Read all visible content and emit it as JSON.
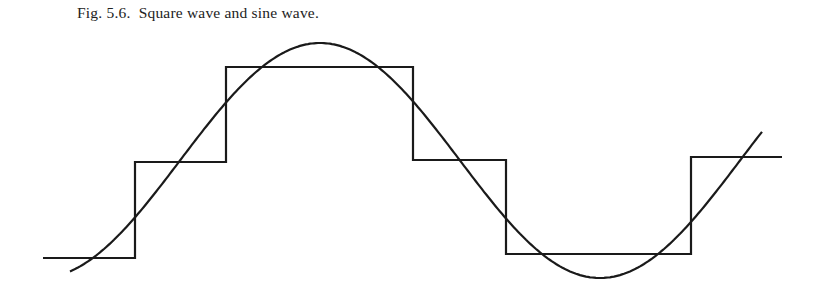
{
  "figure": {
    "caption": "Fig. 5.6.  Square wave and sine wave."
  },
  "chart_data": {
    "type": "line",
    "title": "Fig. 5.6. Square wave and sine wave.",
    "xlabel": "",
    "ylabel": "",
    "grid": false,
    "axes_visible": false,
    "series": [
      {
        "name": "stepped square wave",
        "kind": "step",
        "points_px": [
          [
            43,
            258
          ],
          [
            135,
            258
          ],
          [
            135,
            162
          ],
          [
            226,
            162
          ],
          [
            226,
            67
          ],
          [
            413,
            67
          ],
          [
            413,
            160
          ],
          [
            506,
            160
          ],
          [
            506,
            254
          ],
          [
            691,
            254
          ],
          [
            691,
            157
          ],
          [
            782,
            157
          ]
        ],
        "levels_normalized": [
          -0.85,
          -0.0,
          0.8,
          0.0,
          -0.8,
          0.0
        ]
      },
      {
        "name": "sine wave",
        "kind": "sine",
        "center_y_px": 160.5,
        "amplitude_px": 117.5,
        "period_px": 560,
        "zero_crossing_up_x_px": 180,
        "x_start_px": 70,
        "x_end_px": 763,
        "peak_px": [
          320,
          43
        ],
        "trough_px": [
          600,
          278
        ]
      }
    ],
    "colors": {
      "stroke": "#1a1a1a",
      "background": "#ffffff"
    }
  }
}
